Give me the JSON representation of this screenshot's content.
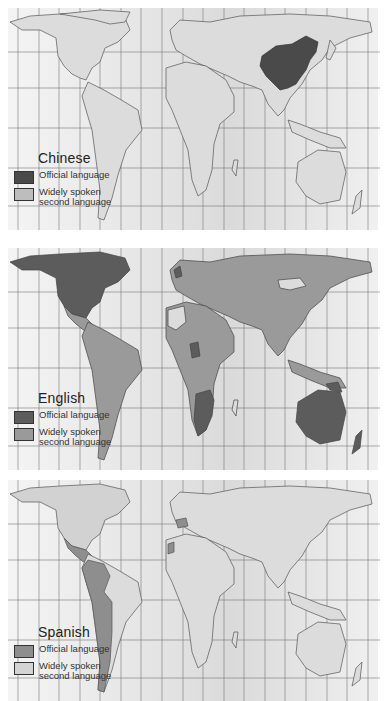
{
  "panels": [
    {
      "id": "chinese",
      "legend": {
        "title": "Chinese",
        "items": [
          {
            "label": "Official language",
            "color": "#4a4a4a"
          },
          {
            "label": "Widely spoken second language",
            "color": "#bdbdbd"
          }
        ]
      },
      "colors": {
        "land": "#dcdcdc",
        "official": "#4a4a4a",
        "second": "#bdbdbd",
        "border": "#555555"
      },
      "official_regions": [
        "China"
      ],
      "second_regions": []
    },
    {
      "id": "english",
      "legend": {
        "title": "English",
        "items": [
          {
            "label": "Official language",
            "color": "#5c5c5c"
          },
          {
            "label": "Widely spoken second language",
            "color": "#9a9a9a"
          }
        ]
      },
      "colors": {
        "land": "#dcdcdc",
        "official": "#5c5c5c",
        "second": "#9a9a9a",
        "border": "#444444"
      },
      "official_regions": [
        "USA",
        "Canada",
        "UK",
        "Ireland",
        "Australia",
        "New Zealand",
        "South Africa",
        "Nigeria",
        "Zimbabwe",
        "Zambia",
        "Botswana",
        "Papua New Guinea",
        "Guyana",
        "Sierra Leone",
        "Liberia"
      ],
      "second_regions": [
        "Mexico",
        "Central America",
        "South America",
        "Europe",
        "Russia",
        "China",
        "India",
        "Middle East",
        "North Africa",
        "East Africa",
        "Southeast Asia",
        "Japan",
        "Indonesia"
      ]
    },
    {
      "id": "spanish",
      "legend": {
        "title": "Spanish",
        "items": [
          {
            "label": "Official language",
            "color": "#8e8e8e"
          },
          {
            "label": "Widely spoken second language",
            "color": "#d4d4d4"
          }
        ]
      },
      "colors": {
        "land": "#dcdcdc",
        "official": "#8e8e8e",
        "second": "#c4c4c4",
        "border": "#555555"
      },
      "official_regions": [
        "Mexico",
        "Central America",
        "Cuba",
        "Colombia",
        "Venezuela",
        "Ecuador",
        "Peru",
        "Bolivia",
        "Chile",
        "Argentina",
        "Paraguay",
        "Uruguay",
        "Spain",
        "Equatorial Guinea",
        "Western Sahara"
      ],
      "second_regions": [
        "USA",
        "Brazil",
        "Morocco"
      ]
    }
  ]
}
